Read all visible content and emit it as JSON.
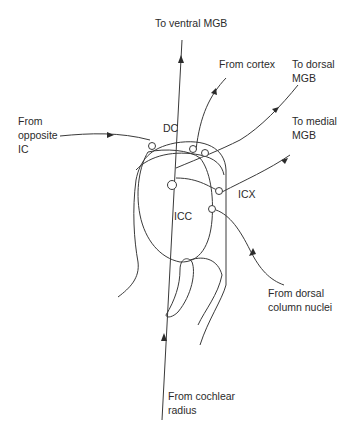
{
  "labels": {
    "to_ventral_mgb": "To ventral MGB",
    "from_cortex": "From cortex",
    "to_dorsal_mgb_1": "To dorsal",
    "to_dorsal_mgb_2": "MGB",
    "from_opposite_ic_1": "From",
    "from_opposite_ic_2": "opposite",
    "from_opposite_ic_3": "IC",
    "dc": "DC",
    "to_medial_mgb_1": "To medial",
    "to_medial_mgb_2": "MGB",
    "icx": "ICX",
    "icc": "ICC",
    "from_dorsal_column_1": "From dorsal",
    "from_dorsal_column_2": "column nuclei",
    "from_cochlear_1": "From cochlear",
    "from_cochlear_2": "radius"
  },
  "colors": {
    "line": "#3a3a3a",
    "text": "#2b2b2b",
    "background": "#ffffff"
  }
}
